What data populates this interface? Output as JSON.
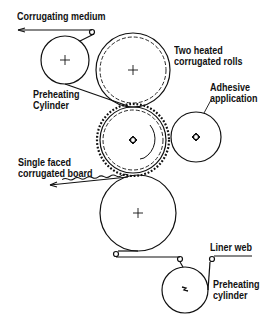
{
  "diagram": {
    "type": "single-facer corrugator schematic",
    "labels": {
      "corrugating_medium": "Corrugating medium",
      "two_heated_rolls_1": "Two heated",
      "two_heated_rolls_2": "corrugated rolls",
      "preheating_cylinder_top_1": "Preheating",
      "preheating_cylinder_top_2": "Cylinder",
      "adhesive_1": "Adhesive",
      "adhesive_2": "application",
      "single_faced_1": "Single faced",
      "single_faced_2": "corrugated board",
      "liner_web": "Liner web",
      "preheating_cylinder_bottom_1": "Preheating",
      "preheating_cylinder_bottom_2": "cylinder"
    },
    "components": [
      {
        "name": "preheating-cylinder-top",
        "cx": 65,
        "cy": 60,
        "r": 24
      },
      {
        "name": "upper-corrugated-roll",
        "cx": 133,
        "cy": 70,
        "r": 37
      },
      {
        "name": "lower-corrugated-roll",
        "cx": 133,
        "cy": 140,
        "r": 36
      },
      {
        "name": "adhesive-roll",
        "cx": 196,
        "cy": 137,
        "r": 25
      },
      {
        "name": "pressure-roll",
        "cx": 138,
        "cy": 213,
        "r": 38
      },
      {
        "name": "preheating-cylinder-bottom",
        "cx": 185,
        "cy": 290,
        "r": 23
      }
    ],
    "colors": {
      "line": "#111111",
      "background": "#ffffff"
    }
  }
}
